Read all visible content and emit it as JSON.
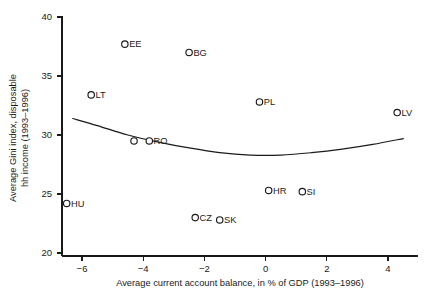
{
  "chart_data": {
    "type": "scatter",
    "title": "",
    "xlabel": "Average current account balance, in % of GDP (1993–1996)",
    "ylabel": "Average Gini index, disposable hh income (1993–1996)",
    "xlim": [
      -6.8,
      4.8
    ],
    "ylim": [
      20,
      40
    ],
    "xticks": [
      -6,
      -4,
      -2,
      0,
      2,
      4
    ],
    "xticklabels": [
      "−6",
      "−4",
      "−2",
      "0",
      "2",
      "4"
    ],
    "yticks": [
      20,
      25,
      30,
      35,
      40
    ],
    "yticklabels": [
      "20",
      "25",
      "30",
      "35",
      "40"
    ],
    "grid": false,
    "legend": null,
    "marker": "open-circle",
    "points": [
      {
        "label": "HU",
        "x": -6.5,
        "y": 24.2
      },
      {
        "label": "LT",
        "x": -5.7,
        "y": 33.4
      },
      {
        "label": "EE",
        "x": -4.6,
        "y": 37.7
      },
      {
        "label": "",
        "x": -4.3,
        "y": 29.5
      },
      {
        "label": "RO",
        "x": -3.8,
        "y": 29.5
      },
      {
        "label": "BG",
        "x": -2.5,
        "y": 37.0
      },
      {
        "label": "CZ",
        "x": -2.3,
        "y": 23.0
      },
      {
        "label": "SK",
        "x": -1.5,
        "y": 22.8
      },
      {
        "label": "PL",
        "x": -0.2,
        "y": 32.8
      },
      {
        "label": "HR",
        "x": 0.1,
        "y": 25.3
      },
      {
        "label": "SI",
        "x": 1.2,
        "y": 25.2
      },
      {
        "label": "LV",
        "x": 4.3,
        "y": 31.9
      }
    ],
    "fit_curve": {
      "name": "quadratic-fit",
      "points": [
        {
          "x": -6.3,
          "y": 31.4
        },
        {
          "x": -5.5,
          "y": 30.8
        },
        {
          "x": -4.5,
          "y": 30.0
        },
        {
          "x": -3.5,
          "y": 29.4
        },
        {
          "x": -2.5,
          "y": 28.9
        },
        {
          "x": -1.5,
          "y": 28.5
        },
        {
          "x": -0.5,
          "y": 28.3
        },
        {
          "x": 0.5,
          "y": 28.3
        },
        {
          "x": 1.5,
          "y": 28.5
        },
        {
          "x": 2.5,
          "y": 28.8
        },
        {
          "x": 3.5,
          "y": 29.2
        },
        {
          "x": 4.5,
          "y": 29.7
        }
      ]
    },
    "colors": {
      "axis": "#1a1a1a",
      "marker_stroke": "#1a1a1a",
      "marker_fill": "#ffffff",
      "curve": "#1a1a1a",
      "background": "#ffffff"
    }
  }
}
